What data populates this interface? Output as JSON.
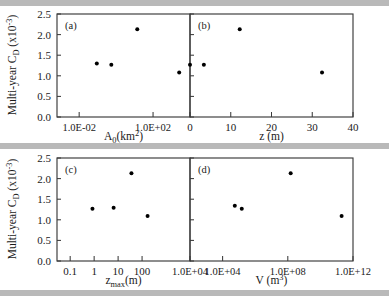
{
  "figure": {
    "background": "#ffffff",
    "axis_color": "#3a3a3a",
    "marker_color": "#000000",
    "banner_color": "#b9b9b9"
  },
  "axis_titles": {
    "y_main": "Multi-year C",
    "y_sub": "D",
    "y_scale": "(x10",
    "y_scale_exp": "-3",
    "y_scale_close": ")",
    "y_full": "Multi-year C_D (x10^-3)"
  },
  "y_axis": {
    "ticks": [
      "0.0",
      "0.5",
      "1.0",
      "1.5",
      "2.0",
      "2.5"
    ],
    "min": 0.0,
    "max": 2.5
  },
  "panels": [
    {
      "tag": "(a)",
      "x_title_main": "A",
      "x_title_sub": "0",
      "x_title_rest": "(km",
      "x_title_exp": "2",
      "x_title_close": ")",
      "x_title_full": "A_0(km^2)",
      "x_scale": "log",
      "x_ticks": [
        "1.0E-02",
        "1.0E+02"
      ],
      "x_tick_values": [
        -2,
        2
      ],
      "x_min": -3.2,
      "x_max": 4.0
    },
    {
      "tag": "(b)",
      "x_title_main": "z (m)",
      "x_title_full": "z (m)",
      "x_scale": "linear",
      "x_ticks": [
        "0",
        "10",
        "20",
        "30",
        "40"
      ],
      "x_tick_values": [
        0,
        10,
        20,
        30,
        40
      ],
      "x_min": 0,
      "x_max": 40
    },
    {
      "tag": "(c)",
      "x_title_main": "z",
      "x_title_sub": "max",
      "x_title_rest": "(m)",
      "x_title_full": "z_max(m)",
      "x_scale": "log",
      "x_ticks": [
        "0.1",
        "1",
        "10",
        "100",
        "1.0E+04"
      ],
      "x_tick_values": [
        -1,
        0,
        1,
        2,
        4
      ],
      "x_min": -1.55,
      "x_max": 4.0
    },
    {
      "tag": "(d)",
      "x_title_main": "V (m",
      "x_title_exp": "3",
      "x_title_close": ")",
      "x_title_full": "V (m^3)",
      "x_scale": "log",
      "x_ticks": [
        "1.0E+04",
        "1.0E+08",
        "1.0E+12"
      ],
      "x_tick_values": [
        4,
        8,
        12
      ],
      "x_min": 2.0,
      "x_max": 12.0
    }
  ],
  "chart_data": [
    {
      "type": "scatter",
      "panel": "(a)",
      "title": "",
      "xlabel": "A_0(km^2)",
      "ylabel": "Multi-year C_D (x10^-3)",
      "xscale": "log",
      "xlim": [
        0.00063,
        10000
      ],
      "ylim": [
        0.0,
        2.5
      ],
      "grid": false,
      "legend": "none",
      "x": [
        0.09,
        0.55,
        14.0,
        2600.0
      ],
      "y": [
        1.3,
        1.27,
        2.13,
        1.08
      ]
    },
    {
      "type": "scatter",
      "panel": "(b)",
      "title": "",
      "xlabel": "z (m)",
      "ylabel": "Multi-year C_D (x10^-3)",
      "xscale": "linear",
      "xlim": [
        0,
        40
      ],
      "ylim": [
        0.0,
        2.5
      ],
      "grid": false,
      "legend": "none",
      "x": [
        0.0,
        3.4,
        12.2,
        32.4
      ],
      "y": [
        1.27,
        1.27,
        2.13,
        1.08
      ]
    },
    {
      "type": "scatter",
      "panel": "(c)",
      "title": "",
      "xlabel": "z_max(m)",
      "ylabel": "Multi-year C_D (x10^-3)",
      "xscale": "log",
      "xlim": [
        0.028,
        10000
      ],
      "ylim": [
        0.0,
        2.5
      ],
      "grid": false,
      "legend": "none",
      "x": [
        0.85,
        6.5,
        36.0,
        170.0
      ],
      "y": [
        1.27,
        1.29,
        2.13,
        1.09
      ]
    },
    {
      "type": "scatter",
      "panel": "(d)",
      "title": "",
      "xlabel": "V (m^3)",
      "ylabel": "Multi-year C_D (x10^-3)",
      "xscale": "log",
      "xlim": [
        100,
        1000000000000
      ],
      "ylim": [
        0.0,
        2.5
      ],
      "grid": false,
      "legend": "none",
      "x": [
        56000,
        150000,
        150000000,
        200000000000
      ],
      "y": [
        1.34,
        1.27,
        2.13,
        1.09
      ]
    }
  ]
}
